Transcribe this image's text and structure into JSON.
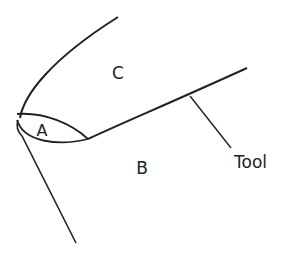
{
  "diagram": {
    "labels": {
      "region_a": "A",
      "region_b": "B",
      "region_c": "C",
      "tool": "Tool"
    },
    "colors": {
      "stroke": "#222222",
      "background": "#ffffff"
    }
  }
}
